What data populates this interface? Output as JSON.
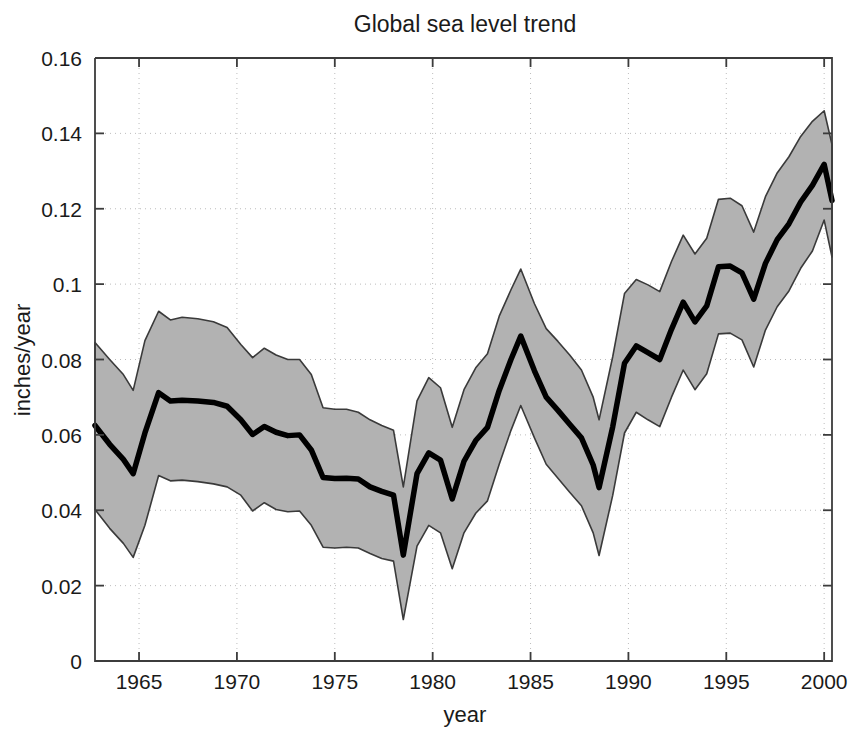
{
  "chart_data": {
    "type": "line",
    "title": "Global sea level trend",
    "xlabel": "year",
    "ylabel": "inches/year",
    "xlim": [
      1962.75,
      2000.4
    ],
    "ylim": [
      0,
      0.16
    ],
    "grid": true,
    "legend": false,
    "xticks": [
      1965,
      1970,
      1975,
      1980,
      1985,
      1990,
      1995,
      2000
    ],
    "xtick_labels": [
      "1965",
      "1970",
      "1975",
      "1980",
      "1985",
      "1990",
      "1995",
      "2000"
    ],
    "yticks": [
      0,
      0.02,
      0.04,
      0.06,
      0.08,
      0.1,
      0.12,
      0.14,
      0.16
    ],
    "ytick_labels": [
      "0",
      "0.02",
      "0.04",
      "0.06",
      "0.08",
      "0.1",
      "0.12",
      "0.14",
      "0.16"
    ],
    "x": [
      1962.75,
      1963.5,
      1964.2,
      1964.7,
      1965.3,
      1966.0,
      1966.6,
      1967.2,
      1968.0,
      1968.8,
      1969.5,
      1970.2,
      1970.8,
      1971.4,
      1972.0,
      1972.6,
      1973.2,
      1973.8,
      1974.4,
      1975.0,
      1975.6,
      1976.2,
      1976.8,
      1977.4,
      1978.0,
      1978.5,
      1979.2,
      1979.8,
      1980.4,
      1981.0,
      1981.6,
      1982.2,
      1982.8,
      1983.4,
      1984.0,
      1984.5,
      1985.2,
      1985.8,
      1986.4,
      1987.0,
      1987.6,
      1988.2,
      1988.5,
      1989.2,
      1989.8,
      1990.4,
      1991.0,
      1991.6,
      1992.2,
      1992.8,
      1993.4,
      1994.0,
      1994.6,
      1995.2,
      1995.8,
      1996.4,
      1997.0,
      1997.6,
      1998.2,
      1998.8,
      1999.4,
      2000.0,
      2000.4
    ],
    "series": [
      {
        "name": "trend",
        "role": "center",
        "color": "#000000",
        "values": [
          0.0625,
          0.0575,
          0.0535,
          0.0497,
          0.0605,
          0.0712,
          0.069,
          0.0692,
          0.069,
          0.0686,
          0.0676,
          0.064,
          0.0601,
          0.0622,
          0.0607,
          0.0598,
          0.06,
          0.056,
          0.0487,
          0.0484,
          0.0485,
          0.0483,
          0.0462,
          0.045,
          0.044,
          0.0281,
          0.0497,
          0.0552,
          0.0533,
          0.043,
          0.053,
          0.0585,
          0.062,
          0.0718,
          0.08,
          0.0862,
          0.077,
          0.07,
          0.0665,
          0.0628,
          0.0592,
          0.052,
          0.046,
          0.0622,
          0.079,
          0.0836,
          0.0818,
          0.08,
          0.088,
          0.0952,
          0.09,
          0.0942,
          0.1046,
          0.1048,
          0.103,
          0.096,
          0.1055,
          0.1118,
          0.116,
          0.1218,
          0.1262,
          0.1318,
          0.1222
        ]
      },
      {
        "name": "upper bound",
        "role": "upper",
        "color": "#b2b2b2",
        "values": [
          0.0845,
          0.08,
          0.076,
          0.0718,
          0.085,
          0.0928,
          0.0905,
          0.0912,
          0.0908,
          0.09,
          0.0885,
          0.084,
          0.0805,
          0.083,
          0.0812,
          0.08,
          0.08,
          0.076,
          0.0672,
          0.0668,
          0.0668,
          0.066,
          0.064,
          0.0625,
          0.0612,
          0.0462,
          0.069,
          0.0752,
          0.0725,
          0.062,
          0.072,
          0.0778,
          0.0815,
          0.0915,
          0.0985,
          0.104,
          0.0948,
          0.0882,
          0.0848,
          0.0812,
          0.0772,
          0.07,
          0.064,
          0.0808,
          0.0975,
          0.1012,
          0.0998,
          0.098,
          0.106,
          0.113,
          0.108,
          0.1122,
          0.1225,
          0.1228,
          0.1208,
          0.1138,
          0.1232,
          0.1295,
          0.1338,
          0.1392,
          0.1432,
          0.146,
          0.137
        ]
      },
      {
        "name": "lower bound",
        "role": "lower",
        "color": "#b2b2b2",
        "values": [
          0.0402,
          0.0352,
          0.0312,
          0.0275,
          0.036,
          0.0492,
          0.0478,
          0.048,
          0.0476,
          0.047,
          0.0462,
          0.044,
          0.0398,
          0.042,
          0.0402,
          0.0396,
          0.0398,
          0.036,
          0.0302,
          0.03,
          0.0302,
          0.03,
          0.0285,
          0.0272,
          0.0265,
          0.011,
          0.0305,
          0.036,
          0.034,
          0.0245,
          0.034,
          0.0392,
          0.0425,
          0.0522,
          0.0612,
          0.0678,
          0.0592,
          0.0522,
          0.0485,
          0.0448,
          0.0412,
          0.034,
          0.028,
          0.044,
          0.0605,
          0.066,
          0.064,
          0.0622,
          0.07,
          0.0772,
          0.072,
          0.0762,
          0.0868,
          0.087,
          0.0852,
          0.078,
          0.0878,
          0.094,
          0.0982,
          0.1042,
          0.1088,
          0.117,
          0.1072
        ]
      }
    ],
    "band_label": "uncertainty band",
    "band_fill": "#b2b2b2",
    "line_color": "#000000",
    "axis_color": "#3c3c3c",
    "grid_color": "#bdbdbd",
    "background": "#ffffff"
  },
  "figure": {
    "plot_left": 95,
    "plot_right": 832,
    "plot_top": 58,
    "plot_bottom": 661
  }
}
